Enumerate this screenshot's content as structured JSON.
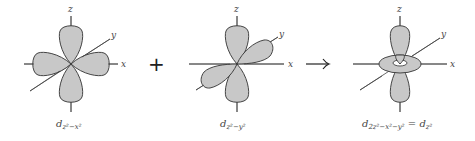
{
  "diagram": {
    "operators": {
      "plus": "+",
      "arrow": "→"
    },
    "axis_labels": {
      "x": "x",
      "y": "y",
      "z": "z"
    },
    "colors": {
      "lobe_fill": "#c8c8c8",
      "lobe_stroke": "#333333",
      "axis": "#444444"
    },
    "orbitals": [
      {
        "id": "dz2-x2",
        "caption_base": "d",
        "caption_sub": "z²−x²",
        "shape": "four lobes in xz plane along z and x axes"
      },
      {
        "id": "dz2-y2",
        "caption_base": "d",
        "caption_sub": "z²−y²",
        "shape": "four lobes in yz plane along z and y axes"
      },
      {
        "id": "dz2",
        "caption_base": "d",
        "caption_sub": "2z²−x²−y²",
        "caption_equals": "=",
        "caption_result_sub": "z²",
        "shape": "two lobes along z with torus in xy plane"
      }
    ]
  }
}
